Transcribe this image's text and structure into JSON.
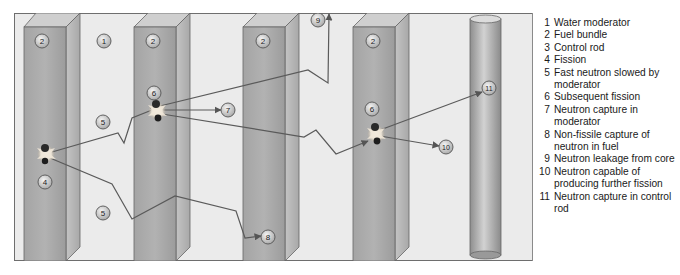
{
  "diagram": {
    "colors": {
      "background": "#ebebeb",
      "fuel_front": "#9a9a9a",
      "fuel_side": "#b8b8b8",
      "fuel_top": "#c8c8c8",
      "control_rod": "#a8a8a8",
      "path_line": "#5a5a5a",
      "border": "#6e6e6e"
    },
    "markers": [
      {
        "id": "m-2a",
        "label": "2",
        "x": 42,
        "y": 41
      },
      {
        "id": "m-1",
        "label": "1",
        "x": 104,
        "y": 41
      },
      {
        "id": "m-2b",
        "label": "2",
        "x": 153,
        "y": 41
      },
      {
        "id": "m-2c",
        "label": "2",
        "x": 263,
        "y": 41
      },
      {
        "id": "m-2d",
        "label": "2",
        "x": 373,
        "y": 41
      },
      {
        "id": "m-9",
        "label": "9",
        "x": 318,
        "y": 20
      },
      {
        "id": "m-6a",
        "label": "6",
        "x": 154,
        "y": 93
      },
      {
        "id": "m-7",
        "label": "7",
        "x": 228,
        "y": 110
      },
      {
        "id": "m-6b",
        "label": "6",
        "x": 372,
        "y": 109
      },
      {
        "id": "m-10",
        "label": "10",
        "x": 446,
        "y": 147
      },
      {
        "id": "m-11",
        "label": "11",
        "x": 489,
        "y": 88
      },
      {
        "id": "m-5a",
        "label": "5",
        "x": 103,
        "y": 122
      },
      {
        "id": "m-4",
        "label": "4",
        "x": 45,
        "y": 182
      },
      {
        "id": "m-5b",
        "label": "5",
        "x": 103,
        "y": 213
      },
      {
        "id": "m-8",
        "label": "8",
        "x": 268,
        "y": 237
      }
    ]
  },
  "legend": {
    "items": [
      {
        "num": "1",
        "text": "Water moderator"
      },
      {
        "num": "2",
        "text": "Fuel bundle"
      },
      {
        "num": "3",
        "text": "Control rod"
      },
      {
        "num": "4",
        "text": "Fission"
      },
      {
        "num": "5",
        "text": "Fast neutron slowed by moderator"
      },
      {
        "num": "6",
        "text": "Subsequent fission"
      },
      {
        "num": "7",
        "text": "Neutron capture in moderator"
      },
      {
        "num": "8",
        "text": "Non-fissile capture of neutron in fuel"
      },
      {
        "num": "9",
        "text": "Neutron leakage from core"
      },
      {
        "num": "10",
        "text": "Neutron capable of producing further fission"
      },
      {
        "num": "11",
        "text": "Neutron capture in control rod"
      }
    ]
  }
}
